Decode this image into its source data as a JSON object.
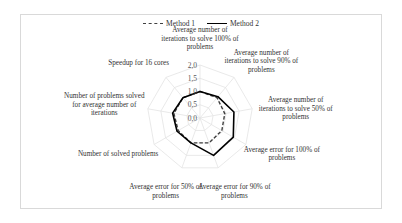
{
  "chart_data": {
    "type": "radar",
    "title": "",
    "axes": [
      "Average number of iterations to solve 100% of problems",
      "Average number of iterations to solve 90% of problems",
      "Average number of iterations to solve 50% of problems",
      "Average error for 100% of problems",
      "Average error for 90% of problems",
      "Average error for 50% of problems",
      "Number of solved problems",
      "Number of problems solved for average number of iterations",
      "Speedup for 16 cores"
    ],
    "axis_label_lines": [
      [
        "Average number of",
        "iterations to solve 100% of",
        "problems"
      ],
      [
        "Average number of",
        "iterations to solve 90% of",
        "problems"
      ],
      [
        "Average number of",
        "iterations to solve 50% of",
        "problems"
      ],
      [
        "Average error for 100% of",
        "problems"
      ],
      [
        "Average error for 90% of",
        "problems"
      ],
      [
        "Average error for 50% of",
        "problems"
      ],
      [
        "Number of solved problems"
      ],
      [
        "Number of problems solved",
        "for average number of",
        "iterations"
      ],
      [
        "Speedup for 16 cores"
      ]
    ],
    "series": [
      {
        "name": "Method 1",
        "style": "dashed",
        "color": "#404040",
        "values": [
          1.0,
          1.0,
          0.95,
          0.95,
          1.0,
          1.0,
          0.95,
          1.0,
          1.0
        ]
      },
      {
        "name": "Method 2",
        "style": "solid",
        "color": "#000000",
        "values": [
          1.0,
          1.05,
          1.3,
          1.45,
          1.5,
          1.0,
          1.0,
          1.05,
          1.0
        ]
      }
    ],
    "radial_ticks": [
      "0,0",
      "0,5",
      "1,0",
      "1,5",
      "2,0"
    ],
    "radial_range": [
      0,
      2.0
    ],
    "grid": true,
    "legend": "top"
  }
}
